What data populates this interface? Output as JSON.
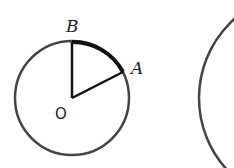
{
  "diagram": {
    "labels": {
      "B": "B",
      "A": "A",
      "O": "O"
    },
    "colors": {
      "stroke": "#444444",
      "arc": "#111111",
      "background": "#ffffff"
    }
  }
}
